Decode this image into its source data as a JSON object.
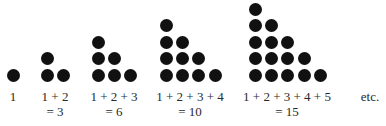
{
  "figure": {
    "dot_color": "#111111",
    "groups": [
      {
        "label_line1": "1",
        "label_line2": "",
        "value": 1,
        "rows": 1
      },
      {
        "label_line1": "1 + 2",
        "label_line2": "= 3",
        "value": 3,
        "rows": 2
      },
      {
        "label_line1": "1 + 2 + 3",
        "label_line2": "= 6",
        "value": 6,
        "rows": 3
      },
      {
        "label_line1": "1 + 2 + 3 + 4",
        "label_line2": "= 10",
        "value": 10,
        "rows": 4
      },
      {
        "label_line1": "1 + 2 + 3 + 4 + 5",
        "label_line2": "= 15",
        "value": 15,
        "rows": 5
      }
    ],
    "trailing_text": "etc."
  }
}
